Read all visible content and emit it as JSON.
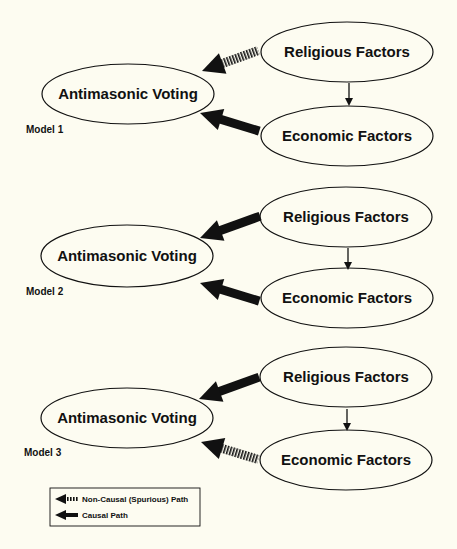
{
  "diagram": {
    "models": [
      {
        "label": "Model 1",
        "nodes": {
          "outcome": "Antimasonic Voting",
          "religious": "Religious Factors",
          "economic": "Economic Factors"
        },
        "paths": [
          {
            "from": "Religious Factors",
            "to": "Antimasonic Voting",
            "type": "non-causal"
          },
          {
            "from": "Economic Factors",
            "to": "Antimasonic Voting",
            "type": "causal"
          },
          {
            "from": "Religious Factors",
            "to": "Economic Factors",
            "type": "link"
          }
        ]
      },
      {
        "label": "Model 2",
        "nodes": {
          "outcome": "Antimasonic Voting",
          "religious": "Religious Factors",
          "economic": "Economic Factors"
        },
        "paths": [
          {
            "from": "Religious Factors",
            "to": "Antimasonic Voting",
            "type": "causal"
          },
          {
            "from": "Economic Factors",
            "to": "Antimasonic Voting",
            "type": "causal"
          },
          {
            "from": "Religious Factors",
            "to": "Economic Factors",
            "type": "link"
          }
        ]
      },
      {
        "label": "Model 3",
        "nodes": {
          "outcome": "Antimasonic Voting",
          "religious": "Religious Factors",
          "economic": "Economic Factors"
        },
        "paths": [
          {
            "from": "Religious Factors",
            "to": "Antimasonic Voting",
            "type": "causal"
          },
          {
            "from": "Economic Factors",
            "to": "Antimasonic Voting",
            "type": "non-causal"
          },
          {
            "from": "Religious Factors",
            "to": "Economic Factors",
            "type": "link"
          }
        ]
      }
    ],
    "legend": {
      "non_causal": "Non-Causal (Spurious) Path",
      "causal": "Causal Path"
    },
    "colors": {
      "background": "#fdfcf1",
      "ink": "#111111"
    }
  }
}
